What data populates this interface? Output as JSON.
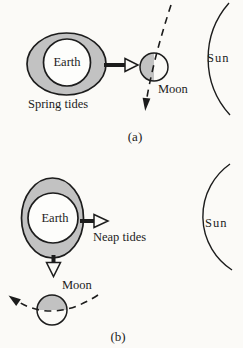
{
  "figure": {
    "colors": {
      "ink": "#1c1c1c",
      "shade": "#c2c2c2",
      "paper": "#fbfaf7"
    },
    "panels": [
      {
        "caption": "(a)",
        "earth_label": "Earth",
        "tide_label": "Spring tides",
        "moon_label": "Moon",
        "sun_label": "Sun"
      },
      {
        "caption": "(b)",
        "earth_label": "Earth",
        "tide_label": "Neap tides",
        "moon_label": "Moon",
        "sun_label": "Sun"
      }
    ]
  }
}
